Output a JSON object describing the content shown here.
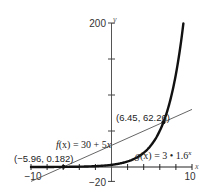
{
  "chart_data": {
    "type": "line",
    "title": "",
    "xlabel": "x",
    "ylabel": "y",
    "xlim": [
      -10,
      10
    ],
    "ylim": [
      -20,
      200
    ],
    "grid": false,
    "x_tick_labels": [
      "-10",
      "10"
    ],
    "y_tick_labels": [
      "200",
      "-20"
    ],
    "x_ticks": [
      -10,
      -8,
      -6,
      -4,
      -2,
      0,
      2,
      4,
      6,
      8,
      10
    ],
    "y_ticks": [
      -20,
      0,
      50,
      100,
      150,
      200
    ],
    "series": [
      {
        "name": "f(x) = 30 + 5x",
        "kind": "linear",
        "expression": "30 + 5x",
        "domain": [
          -10,
          10
        ],
        "points": [
          [
            -10,
            -20
          ],
          [
            10,
            80
          ]
        ],
        "style": "thin",
        "color": "#555555"
      },
      {
        "name": "g(x) = 3 · 1.6^x",
        "kind": "exponential",
        "expression": "3 * 1.6^x",
        "domain": [
          -10,
          8.93
        ],
        "style": "thick",
        "color": "#111111"
      }
    ],
    "annotations": [
      {
        "text": "(-5.96, 0.182)",
        "x": -5.96,
        "y": 0.182,
        "type": "intersection"
      },
      {
        "text": "(6.45, 62.26)",
        "x": 6.45,
        "y": 62.26,
        "type": "intersection"
      },
      {
        "text": "f(x) = 30 + 5x",
        "type": "label"
      },
      {
        "text": "g(x) = 3 • 1.6^x",
        "type": "label"
      }
    ]
  },
  "labels": {
    "x_axis_name": "x",
    "y_axis_name": "y",
    "x_min_label": "−10",
    "x_max_label": "10",
    "y_max_label": "200",
    "y_min_label": "−20",
    "point_left": "(−5.96, 0.182)",
    "point_right": "(6.45, 62.26)",
    "f_name": "f",
    "f_rest": "(x) = 30 + 5",
    "f_var": "x",
    "g_name": "g",
    "g_rest": "(x) = 3 • 1.6",
    "g_exp": "x"
  }
}
